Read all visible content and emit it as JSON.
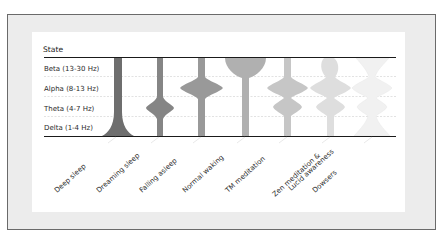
{
  "diagram": {
    "y_axis_title": "State",
    "rows": [
      {
        "label": "Beta (13-30 Hz)"
      },
      {
        "label": "Alpha (8-13 Hz)"
      },
      {
        "label": "Theta (4-7 Hz)"
      },
      {
        "label": "Delta (1-4 Hz)"
      }
    ],
    "columns": [
      {
        "label": "Deep sleep",
        "color": "#6e6e6e",
        "description": "dominant Delta, narrow through other bands"
      },
      {
        "label": "Dreaming sleep",
        "color": "#858585",
        "description": "Theta bulge"
      },
      {
        "label": "Falling asleep",
        "color": "#999999",
        "description": "Alpha bulge"
      },
      {
        "label": "Normal waking",
        "color": "#b0b0b0",
        "description": "large Beta bulge"
      },
      {
        "label": "TM meditation",
        "color": "#c6c6c6",
        "description": "Alpha and Theta bulges"
      },
      {
        "label": "Zen meditation & Lucid awareness",
        "label_line1": "Zen meditation &",
        "label_line2": "Lucid awareness",
        "color": "#dedede",
        "description": "Beta, Alpha and Theta bulges"
      },
      {
        "label": "Dowsers",
        "color": "#f0f0f0",
        "description": "balanced across all bands, wide Beta and Delta"
      }
    ]
  },
  "colors": {
    "frame_bg": "#ececec",
    "frame_border": "#6a6a6a",
    "panel_bg": "#ffffff",
    "axis_line": "#1a1a1a",
    "gridline": "#d0d0d0"
  }
}
